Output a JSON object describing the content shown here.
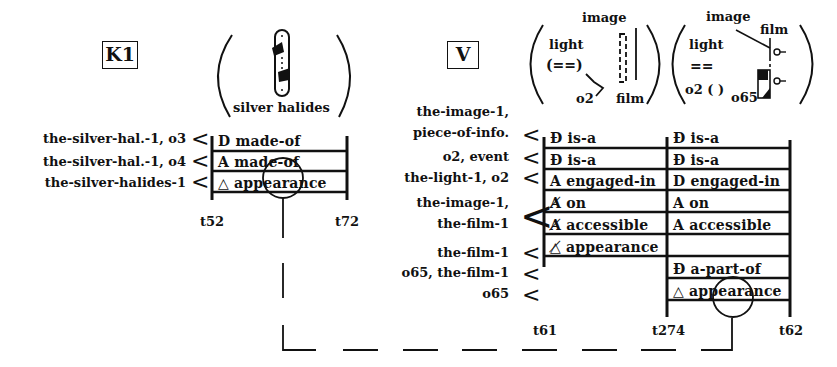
{
  "k1": {
    "label": "K1",
    "picture_caption": "silver halides",
    "rows": [
      {
        "left": "the-silver-hal.-1, o3",
        "cell": "D made-of"
      },
      {
        "left": "the-silver-hal.-1, o4",
        "cell": "A made-of"
      },
      {
        "left": "the-silver-halides-1",
        "cell": "△ appearance"
      }
    ],
    "ticks": {
      "start": "t52",
      "end": "t72"
    }
  },
  "v": {
    "label": "V",
    "picture1": {
      "image": "image",
      "light": "light",
      "beam": "(==)",
      "o2": "o2",
      "film": "film"
    },
    "picture2": {
      "image": "image",
      "film": "film",
      "light": "light",
      "beam": "==",
      "o2": "o2 ( )",
      "o65": "o65"
    },
    "left_labels": [
      {
        "text": "the-image-1,"
      },
      {
        "text": "piece-of-info."
      },
      {
        "text": "o2, event"
      },
      {
        "text": "the-light-1, o2"
      },
      {
        "text": "the-image-1,"
      },
      {
        "text": "the-film-1"
      },
      {
        "text": "the-film-1"
      },
      {
        "text": "o65, the-film-1"
      },
      {
        "text": "o65"
      }
    ],
    "col1": [
      "Ɖ is-a",
      "Ɖ is-a",
      "A engaged-in",
      "A̸ on",
      "A̸ accessible",
      "△̸ appearance"
    ],
    "col2": [
      "Ɖ is-a",
      "Ɖ is-a",
      "D engaged-in",
      "A on",
      "A accessible",
      "",
      "Ɖ a-part-of",
      "△ appearance"
    ],
    "ticks": {
      "start": "t61",
      "mid": "t274",
      "end": "t62"
    }
  },
  "lt": "<"
}
